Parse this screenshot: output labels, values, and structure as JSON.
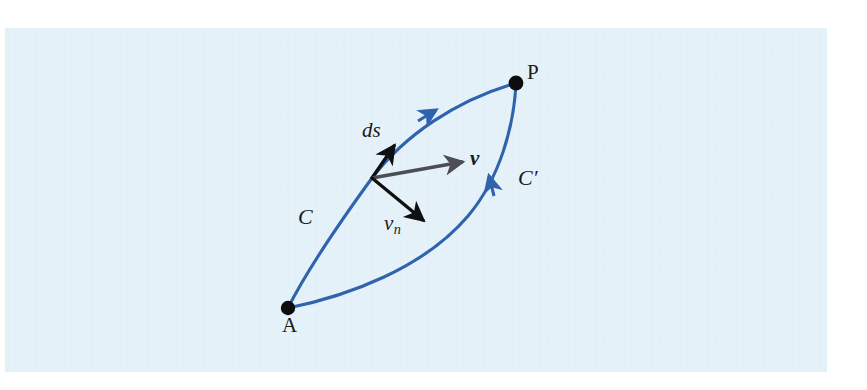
{
  "figure": {
    "domain": "Diagram",
    "kind": "vector-field-line-integral-diagram",
    "background_page_color": "#ffffff",
    "plate_color": "#e2f0f8",
    "curve_color": "#2f63ad",
    "vector_color": "#101010",
    "velocity_vector_color": "#4d4d55",
    "point_color": "#0d0d0d"
  },
  "labels": {
    "point_a": "A",
    "point_p": "P",
    "curve_c": "C",
    "curve_c_prime_base": "C",
    "curve_c_prime_mark": "′",
    "arc_element": "ds",
    "velocity": "v",
    "normal_velocity_base": "v",
    "normal_velocity_sub": "n"
  },
  "geometry": {
    "point_a": {
      "x": 288,
      "y": 308
    },
    "point_p": {
      "x": 516,
      "y": 83
    },
    "junction": {
      "x": 372,
      "y": 178
    },
    "ds_tip": {
      "x": 395,
      "y": 145
    },
    "v_tip": {
      "x": 464,
      "y": 161
    },
    "vn_tip": {
      "x": 425,
      "y": 222
    },
    "curve_c_arrow": {
      "x": 432,
      "y": 112
    },
    "curve_cp_arrow": {
      "x": 490,
      "y": 178
    }
  }
}
